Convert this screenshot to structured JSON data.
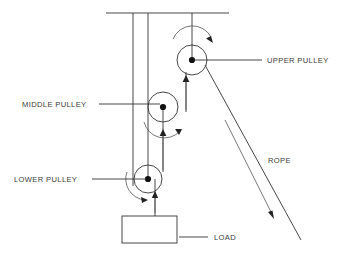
{
  "diagram": {
    "background_color": "#ffffff",
    "line_color": "#333333",
    "text_color": "#3c3c3c",
    "hub_color": "#111111"
  },
  "labels": {
    "upper_pulley": "UPPER PULLEY",
    "middle_pulley": "MIDDLE PULLEY",
    "lower_pulley": "LOWER PULLEY",
    "rope": "ROPE",
    "load": "LOAD"
  },
  "components": {
    "ceiling": {
      "name": "ceiling-support",
      "x1": 106,
      "y1": 13,
      "x2": 229,
      "y2": 13
    },
    "pulleys": [
      {
        "name": "upper-pulley",
        "cx": 192,
        "cy": 60,
        "r": 15,
        "spin": "clockwise"
      },
      {
        "name": "middle-pulley",
        "cx": 163,
        "cy": 107,
        "r": 15,
        "spin": "clockwise"
      },
      {
        "name": "lower-pulley",
        "cx": 148,
        "cy": 179,
        "r": 14,
        "spin": "clockwise"
      }
    ],
    "load_box": {
      "name": "load-block",
      "x": 122,
      "y": 216,
      "w": 55,
      "h": 27
    },
    "rope_segments": [
      {
        "name": "rope-ceiling-left",
        "x1": 133,
        "y1": 13,
        "x2": 133,
        "y2": 186
      },
      {
        "name": "rope-ceiling-mid",
        "x1": 148,
        "y1": 13,
        "x2": 148,
        "y2": 179
      },
      {
        "name": "rope-ceiling-upper",
        "x1": 192,
        "y1": 13,
        "x2": 192,
        "y2": 60
      },
      {
        "name": "rope-upper-to-middle",
        "x1": 186,
        "y1": 75,
        "x2": 186,
        "y2": 110
      },
      {
        "name": "rope-middle-to-lower",
        "x1": 163,
        "y1": 107,
        "x2": 163,
        "y2": 170
      },
      {
        "name": "rope-lower-to-load",
        "x1": 155,
        "y1": 179,
        "x2": 155,
        "y2": 216
      },
      {
        "name": "rope-free-end",
        "x1": 205,
        "y1": 66,
        "x2": 300,
        "y2": 240
      }
    ],
    "force_arrows": [
      {
        "name": "arrow-up-upper",
        "x": 186,
        "from_y": 110,
        "to_y": 76
      },
      {
        "name": "arrow-up-middle",
        "x": 163,
        "from_y": 170,
        "to_y": 130
      },
      {
        "name": "arrow-up-load",
        "x": 155,
        "from_y": 212,
        "to_y": 192
      },
      {
        "name": "arrow-rope-pull",
        "x1": 225,
        "y1": 120,
        "x2": 273,
        "y2": 216
      }
    ]
  }
}
